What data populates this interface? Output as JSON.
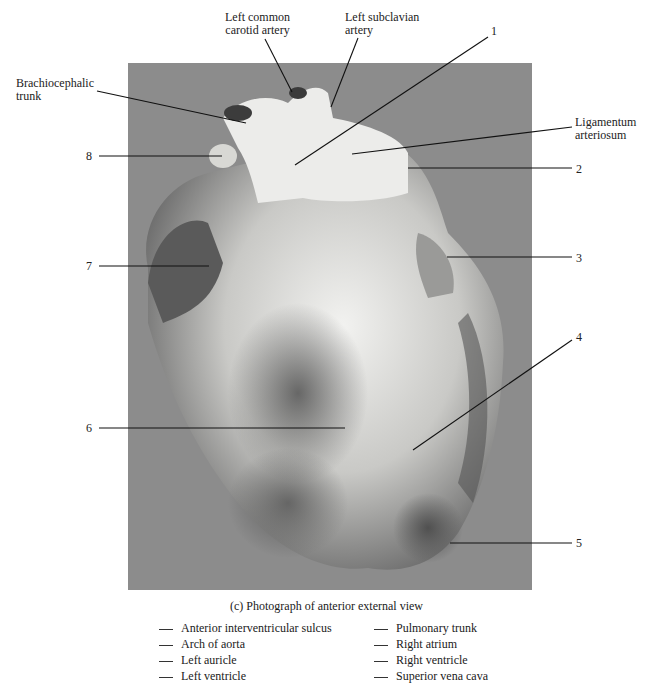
{
  "figure": {
    "caption": "(c) Photograph of anterior external view",
    "photo_background": "#8c8c8c",
    "callouts_named": {
      "left_common_carotid": [
        "Left common",
        "carotid artery"
      ],
      "left_subclavian": [
        "Left subclavian",
        "artery"
      ],
      "brachiocephalic": [
        "Brachiocephalic",
        "trunk"
      ],
      "ligamentum": [
        "Ligamentum",
        "arteriosum"
      ]
    },
    "callouts_numbered": [
      "1",
      "2",
      "3",
      "4",
      "5",
      "6",
      "7",
      "8"
    ]
  },
  "answer_key": {
    "left_column": [
      "Anterior interventricular sulcus",
      "Arch of aorta",
      "Left auricle",
      "Left ventricle"
    ],
    "right_column": [
      "Pulmonary trunk",
      "Right atrium",
      "Right ventricle",
      "Superior vena cava"
    ]
  }
}
